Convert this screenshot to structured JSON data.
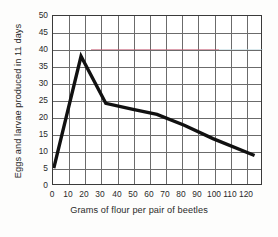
{
  "chart_data": {
    "type": "line",
    "title": "",
    "xlabel": "Grams of flour  per pair of beetles",
    "ylabel": "Eggs and larvae produced in 11 days",
    "xlim": [
      0,
      130
    ],
    "ylim": [
      0,
      50
    ],
    "xticks": [
      0,
      10,
      20,
      30,
      40,
      50,
      60,
      70,
      80,
      90,
      100,
      110,
      120
    ],
    "yticks": [
      0,
      5,
      10,
      15,
      20,
      25,
      30,
      35,
      40,
      45,
      50
    ],
    "grid": true,
    "legend": "none",
    "series": [
      {
        "name": "Eggs and larvae produced in 11 days",
        "color": "#111111",
        "linewidth": 3,
        "x": [
          0.5,
          17.5,
          33,
          50,
          65,
          82,
          100,
          126
        ],
        "y": [
          4.7,
          38.0,
          24.0,
          22.2,
          20.7,
          17.5,
          13.5,
          8.5
        ]
      }
    ]
  },
  "figure": {
    "background": "#fdfdfc",
    "plot_background": "#ffffff",
    "axis_color": "#3a3a3a",
    "grid_color": "#6b6b6b",
    "line_color": "#111111",
    "tint_marks": [
      {
        "color": "#c0506a",
        "label": "pink-scan-artifact"
      },
      {
        "color": "#bcd7df",
        "label": "cyan-scan-artifact"
      }
    ]
  }
}
